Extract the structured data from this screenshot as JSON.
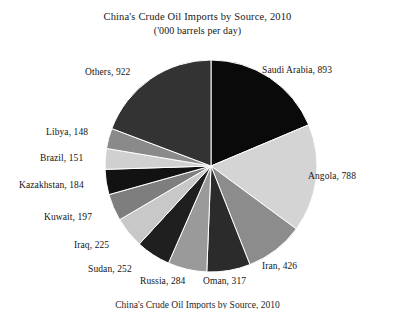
{
  "header": {
    "title": "China's Crude Oil Imports by Source, 2010",
    "subtitle": "('000 barrels per day)"
  },
  "footnote": {
    "text": "China's Crude Oil Imports by Source, 2010"
  },
  "chart_data": {
    "type": "pie",
    "title": "China's Crude Oil Imports by Source, 2010",
    "subtitle": "('000 barrels per day)",
    "unit": "'000 barrels per day",
    "xlabel": "",
    "ylabel": "",
    "legend_position": "none",
    "grid": false,
    "start_angle_deg": 0,
    "direction": "clockwise",
    "categories": [
      "Saudi Arabia",
      "Angola",
      "Iran",
      "Oman",
      "Russia",
      "Sudan",
      "Iraq",
      "Kuwait",
      "Kazakhstan",
      "Brazil",
      "Libya",
      "Others"
    ],
    "values": [
      893,
      788,
      426,
      317,
      284,
      252,
      225,
      197,
      184,
      151,
      148,
      922
    ],
    "colors": [
      "#0a0a0a",
      "#d4d4d4",
      "#8c8c8c",
      "#2b2b2b",
      "#9a9a9a",
      "#1f1f1f",
      "#c8c8c8",
      "#7e7e7e",
      "#121212",
      "#d0d0d0",
      "#8a8a8a",
      "#333333"
    ],
    "slices": [
      {
        "label": "Saudi Arabia, 893",
        "name": "Saudi Arabia",
        "value": 893,
        "color": "#0a0a0a"
      },
      {
        "label": "Angola, 788",
        "name": "Angola",
        "value": 788,
        "color": "#d4d4d4"
      },
      {
        "label": "Iran, 426",
        "name": "Iran",
        "value": 426,
        "color": "#8c8c8c"
      },
      {
        "label": "Oman, 317",
        "name": "Oman",
        "value": 317,
        "color": "#2b2b2b"
      },
      {
        "label": "Russia, 284",
        "name": "Russia",
        "value": 284,
        "color": "#9a9a9a"
      },
      {
        "label": "Sudan, 252",
        "name": "Sudan",
        "value": 252,
        "color": "#1f1f1f"
      },
      {
        "label": "Iraq, 225",
        "name": "Iraq",
        "value": 225,
        "color": "#c8c8c8"
      },
      {
        "label": "Kuwait, 197",
        "name": "Kuwait",
        "value": 197,
        "color": "#7e7e7e"
      },
      {
        "label": "Kazakhstan, 184",
        "name": "Kazakhstan",
        "value": 184,
        "color": "#121212"
      },
      {
        "label": "Brazil, 151",
        "name": "Brazil",
        "value": 151,
        "color": "#d0d0d0"
      },
      {
        "label": "Libya, 148",
        "name": "Libya",
        "value": 148,
        "color": "#8a8a8a"
      },
      {
        "label": "Others, 922",
        "name": "Others",
        "value": 922,
        "color": "#333333"
      }
    ]
  },
  "labels": {
    "saudi_arabia": "Saudi Arabia, 893",
    "angola": "Angola, 788",
    "iran": "Iran, 426",
    "oman": "Oman, 317",
    "russia": "Russia, 284",
    "sudan": "Sudan, 252",
    "iraq": "Iraq, 225",
    "kuwait": "Kuwait, 197",
    "kazakhstan": "Kazakhstan, 184",
    "brazil": "Brazil, 151",
    "libya": "Libya, 148",
    "others": "Others, 922"
  }
}
